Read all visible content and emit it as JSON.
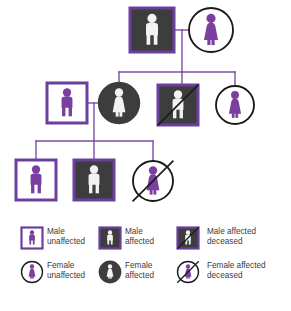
{
  "colors": {
    "purple_border": "#6b3f9e",
    "purple_figure": "#7b3fa0",
    "affected_fill": "#3d3d3d",
    "unaffected_fill": "#ffffff",
    "figure_light": "#f2f2f2",
    "line": "#7a4fa8",
    "deceased_slash": "#1a1a1a",
    "circle_stroke": "#1a1a1a",
    "text": "#3c3c3c",
    "background": "#ffffff"
  },
  "pedigree": {
    "generations": [
      {
        "id": "generation-1",
        "individuals": [
          {
            "id": "g1-father",
            "label": "Male affected",
            "sex": "male",
            "shape": "square",
            "affected": true,
            "deceased": false,
            "cx": 152,
            "cy": 30,
            "size": 44
          },
          {
            "id": "g1-mother",
            "label": "Female unaffected",
            "sex": "female",
            "shape": "circle",
            "affected": false,
            "deceased": false,
            "cx": 211,
            "cy": 30,
            "size": 44
          }
        ]
      },
      {
        "id": "generation-2",
        "individuals": [
          {
            "id": "g2-spouse-male",
            "label": "Male unaffected",
            "sex": "male",
            "shape": "square",
            "affected": false,
            "deceased": false,
            "cx": 67,
            "cy": 103,
            "size": 40
          },
          {
            "id": "g2-daughter",
            "label": "Female affected",
            "sex": "female",
            "shape": "circle",
            "affected": true,
            "deceased": false,
            "cx": 119,
            "cy": 103,
            "size": 40
          },
          {
            "id": "g2-son",
            "label": "Male affected deceased",
            "sex": "male",
            "shape": "square",
            "affected": true,
            "deceased": true,
            "cx": 178,
            "cy": 105,
            "size": 40
          },
          {
            "id": "g2-daughter-2",
            "label": "Female unaffected",
            "sex": "female",
            "shape": "circle",
            "affected": false,
            "deceased": false,
            "cx": 235,
            "cy": 105,
            "size": 38
          }
        ]
      },
      {
        "id": "generation-3",
        "individuals": [
          {
            "id": "g3-child-1",
            "label": "Male unaffected",
            "sex": "male",
            "shape": "square",
            "affected": false,
            "deceased": false,
            "cx": 36,
            "cy": 180,
            "size": 40
          },
          {
            "id": "g3-child-2",
            "label": "Male affected",
            "sex": "male",
            "shape": "square",
            "affected": true,
            "deceased": false,
            "cx": 94,
            "cy": 180,
            "size": 40
          },
          {
            "id": "g3-child-3",
            "label": "Female affected deceased",
            "sex": "female",
            "shape": "circle",
            "affected": false,
            "deceased": true,
            "cx": 153,
            "cy": 181,
            "size": 40
          }
        ]
      }
    ],
    "connections": [
      {
        "id": "mating-line-g1",
        "type": "mating",
        "x1": 175,
        "y1": 30,
        "x2": 189,
        "y2": 30
      },
      {
        "id": "descent-line-g1",
        "type": "descent",
        "x1": 182,
        "y1": 30,
        "x2": 182,
        "y2": 72
      },
      {
        "id": "sibship-line-g2",
        "type": "sibship",
        "x1": 119,
        "y1": 72,
        "x2": 235,
        "y2": 72
      },
      {
        "id": "drop-g2-daughter",
        "type": "drop",
        "x1": 119,
        "y1": 72,
        "x2": 119,
        "y2": 85
      },
      {
        "id": "drop-g2-son",
        "type": "drop",
        "x1": 182,
        "y1": 72,
        "x2": 182,
        "y2": 86
      },
      {
        "id": "drop-g2-daughter-2",
        "type": "drop",
        "x1": 235,
        "y1": 72,
        "x2": 235,
        "y2": 87
      },
      {
        "id": "mating-line-g2",
        "type": "mating",
        "x1": 88,
        "y1": 103,
        "x2": 100,
        "y2": 103
      },
      {
        "id": "descent-line-g2",
        "type": "descent",
        "x1": 94,
        "y1": 103,
        "x2": 94,
        "y2": 141
      },
      {
        "id": "sibship-line-g3",
        "type": "sibship",
        "x1": 36,
        "y1": 141,
        "x2": 153,
        "y2": 141
      },
      {
        "id": "drop-g3-child-1",
        "type": "drop",
        "x1": 36,
        "y1": 141,
        "x2": 36,
        "y2": 161
      },
      {
        "id": "drop-g3-child-2",
        "type": "drop",
        "x1": 94,
        "y1": 141,
        "x2": 94,
        "y2": 161
      },
      {
        "id": "drop-g3-child-3",
        "type": "drop",
        "x1": 153,
        "y1": 141,
        "x2": 153,
        "y2": 163
      }
    ]
  },
  "legend": {
    "items": [
      {
        "id": "legend-male-unaffected",
        "sex": "male",
        "shape": "square",
        "affected": false,
        "deceased": false,
        "line1": "Male",
        "line2": "unaffected",
        "sym_cx": 32,
        "sym_cy": 23,
        "text_x": 47,
        "text_y": 19
      },
      {
        "id": "legend-male-affected",
        "sex": "male",
        "shape": "square",
        "affected": true,
        "deceased": false,
        "line1": "Male",
        "line2": "affected",
        "sym_cx": 110,
        "sym_cy": 23,
        "text_x": 125,
        "text_y": 19
      },
      {
        "id": "legend-male-affected-deceased",
        "sex": "male",
        "shape": "square",
        "affected": true,
        "deceased": true,
        "line1": "Male affected",
        "line2": "deceased",
        "sym_cx": 188,
        "sym_cy": 23,
        "text_x": 207,
        "text_y": 19
      },
      {
        "id": "legend-female-unaffected",
        "sex": "female",
        "shape": "circle",
        "affected": false,
        "deceased": false,
        "line1": "Female",
        "line2": "unaffected",
        "sym_cx": 32,
        "sym_cy": 57,
        "text_x": 47,
        "text_y": 53
      },
      {
        "id": "legend-female-affected",
        "sex": "female",
        "shape": "circle",
        "affected": true,
        "deceased": false,
        "line1": "Female",
        "line2": "affected",
        "sym_cx": 110,
        "sym_cy": 57,
        "text_x": 125,
        "text_y": 53
      },
      {
        "id": "legend-female-affected-deceased",
        "sex": "female",
        "shape": "circle",
        "affected": false,
        "deceased": true,
        "line1": "Female affected",
        "line2": "deceased",
        "sym_cx": 188,
        "sym_cy": 57,
        "text_x": 207,
        "text_y": 53
      }
    ]
  }
}
